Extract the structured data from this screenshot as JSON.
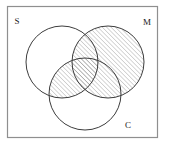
{
  "figure": {
    "kind": "venn-diagram",
    "title": "",
    "universe_box": {
      "x": 7.5,
      "y": 6.5,
      "width": 150,
      "height": 131,
      "stroke": "#8f8f8f",
      "stroke_width": 1.2,
      "fill": "#ffffff"
    },
    "shading": {
      "description": "M union (S intersect C)",
      "pattern": "diagonal-hatch",
      "hatch_direction": "/",
      "hatch_color": "#6b6b6b",
      "hatch_spacing_px": 3.1,
      "hatch_stroke_width": 0.55
    },
    "circle_stroke": "#3d3d3d",
    "circle_stroke_width": 1.0,
    "circle_fill": "#ffffff",
    "sets": [
      {
        "id": "S",
        "label": "S",
        "cx": 62,
        "cy": 62,
        "r": 36,
        "label_x": 17,
        "label_y": 24,
        "shaded": false
      },
      {
        "id": "M",
        "label": "M",
        "cx": 108,
        "cy": 62,
        "r": 36,
        "label_x": 147,
        "label_y": 25,
        "shaded": true
      },
      {
        "id": "C",
        "label": "C",
        "cx": 85,
        "cy": 94,
        "r": 36,
        "label_x": 128,
        "label_y": 128,
        "shaded": false
      }
    ],
    "shaded_regions": [
      {
        "id": "M",
        "expression": "M"
      },
      {
        "id": "S-and-C",
        "expression": "S ∩ C"
      }
    ]
  }
}
